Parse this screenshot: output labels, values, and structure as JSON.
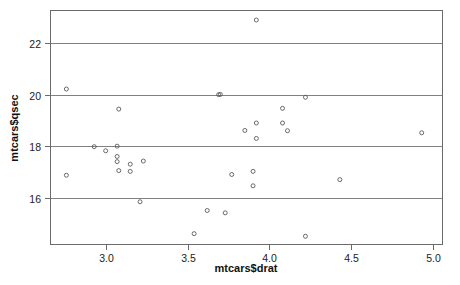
{
  "chart_data": {
    "type": "scatter",
    "title": "",
    "subtitle": "",
    "xlabel": "mtcars$drat",
    "ylabel": "mtcars$qsec",
    "xlim": [
      2.66,
      5.06
    ],
    "ylim": [
      14.16,
      23.29
    ],
    "xticks": [
      "3.0",
      "3.5",
      "4.0",
      "4.5",
      "5.0"
    ],
    "xtick_values": [
      3.0,
      3.5,
      4.0,
      4.5,
      5.0
    ],
    "yticks": [
      "16",
      "18",
      "20",
      "22"
    ],
    "ytick_values": [
      16,
      18,
      20,
      22
    ],
    "grid": "horizontal",
    "grid_values": [
      16,
      18,
      20,
      22
    ],
    "legend": "none",
    "marker": "open-circle",
    "marker_size": 4,
    "x": [
      3.9,
      3.9,
      3.85,
      3.08,
      3.15,
      2.76,
      3.21,
      3.69,
      3.92,
      3.92,
      3.92,
      3.07,
      3.07,
      3.07,
      2.93,
      3.0,
      3.23,
      4.08,
      4.93,
      4.22,
      3.7,
      2.76,
      3.15,
      3.73,
      3.08,
      4.08,
      4.43,
      3.77,
      4.22,
      3.62,
      3.54,
      4.11
    ],
    "y": [
      16.46,
      17.02,
      18.61,
      19.44,
      17.02,
      20.22,
      15.84,
      20.0,
      22.9,
      18.3,
      18.9,
      17.4,
      17.6,
      18.0,
      17.98,
      17.82,
      17.42,
      19.47,
      18.52,
      19.9,
      20.01,
      16.87,
      17.3,
      15.41,
      17.05,
      18.9,
      16.7,
      16.9,
      14.5,
      15.5,
      14.6,
      18.6
    ],
    "series_name": "mtcars"
  },
  "figure": {
    "background": "#ffffff",
    "frame_color": "#6a6a6a",
    "grid_color": "#808080",
    "point_color": "#5a5a5a",
    "text_color": "#1a1a1a"
  }
}
